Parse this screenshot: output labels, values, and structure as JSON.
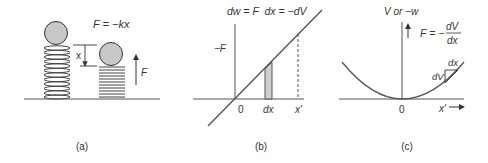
{
  "colors": {
    "line": "#555555",
    "ink": "#333333",
    "ball_fill": "#c8c8c8",
    "shade_fill": "#cfcfcf"
  },
  "panel_a": {
    "caption": "(a)",
    "equation": "F = −kx",
    "displacement_label": "x",
    "force_label": "F"
  },
  "panel_b": {
    "caption": "(b)",
    "equation": "dw = F  dx = −dV",
    "y_axis_label": "−F",
    "origin_label": "0",
    "strip_label": "dx",
    "endpoint_label": "x′"
  },
  "panel_c": {
    "caption": "(c)",
    "y_axis_label": "V or −w",
    "force_eq_lhs": "F = −",
    "force_eq_num": "dV",
    "force_eq_den": "dx",
    "tri_dx_label": "dx",
    "tri_dv_label": "dV",
    "origin_label": "0",
    "x_axis_label": "x′"
  }
}
